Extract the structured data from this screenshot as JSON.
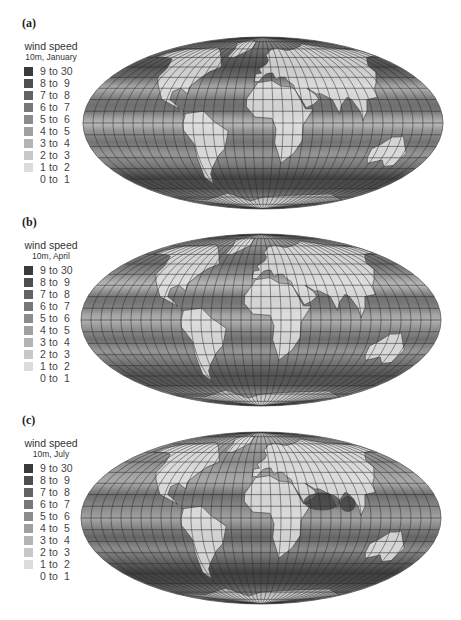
{
  "figure": {
    "panels": [
      {
        "id": "a",
        "label": "(a)",
        "legend_title": "wind speed",
        "legend_subtitle": "10m, January",
        "month": "January"
      },
      {
        "id": "b",
        "label": "(b)",
        "legend_title": "wind speed",
        "legend_subtitle": "10m, April",
        "month": "April"
      },
      {
        "id": "c",
        "label": "(c)",
        "legend_title": "wind speed",
        "legend_subtitle": "10m, July",
        "month": "July"
      }
    ],
    "legend_classes": [
      {
        "range": "9 to 30",
        "color": "#3a3a3a"
      },
      {
        "range": "8 to  9",
        "color": "#4e4e4e"
      },
      {
        "range": "7 to  8",
        "color": "#636363"
      },
      {
        "range": "6 to  7",
        "color": "#787878"
      },
      {
        "range": "5 to  6",
        "color": "#8c8c8c"
      },
      {
        "range": "4 to  5",
        "color": "#a0a0a0"
      },
      {
        "range": "3 to  4",
        "color": "#b4b4b4"
      },
      {
        "range": "2 to  3",
        "color": "#c8c8c8"
      },
      {
        "range": "1 to  2",
        "color": "#dcdcdc"
      },
      {
        "range": "0 to  1",
        "color": "#ffffff"
      }
    ],
    "projection": "Mollweide",
    "graticule_spacing_deg": 10
  },
  "chart_data": [
    {
      "type": "heatmap",
      "title": "wind speed 10m, January",
      "panel": "(a)",
      "units": "m/s",
      "legend_bins": [
        "9 to 30",
        "8 to 9",
        "7 to 8",
        "6 to 7",
        "5 to 6",
        "4 to 5",
        "3 to 4",
        "2 to 3",
        "1 to 2",
        "0 to 1"
      ],
      "zonal_bands_approx": [
        {
          "lat": "60N-50N",
          "class": "8 to 9"
        },
        {
          "lat": "40N",
          "class": "7 to 8"
        },
        {
          "lat": "20N-10N trade winds",
          "class": "6 to 7"
        },
        {
          "lat": "0",
          "class": "4 to 5"
        },
        {
          "lat": "20S-10S",
          "class": "5 to 6"
        },
        {
          "lat": "50S-40S",
          "class": "9 to 30"
        }
      ]
    },
    {
      "type": "heatmap",
      "title": "wind speed 10m, April",
      "panel": "(b)",
      "units": "m/s",
      "legend_bins": [
        "9 to 30",
        "8 to 9",
        "7 to 8",
        "6 to 7",
        "5 to 6",
        "4 to 5",
        "3 to 4",
        "2 to 3",
        "1 to 2",
        "0 to 1"
      ],
      "zonal_bands_approx": [
        {
          "lat": "60N-50N",
          "class": "6 to 7"
        },
        {
          "lat": "20N-10N trade winds",
          "class": "6 to 7"
        },
        {
          "lat": "0",
          "class": "4 to 5"
        },
        {
          "lat": "20S-10S",
          "class": "6 to 7"
        },
        {
          "lat": "50S-40S",
          "class": "8 to 9"
        }
      ]
    },
    {
      "type": "heatmap",
      "title": "wind speed 10m, July",
      "panel": "(c)",
      "units": "m/s",
      "legend_bins": [
        "9 to 30",
        "8 to 9",
        "7 to 8",
        "6 to 7",
        "5 to 6",
        "4 to 5",
        "3 to 4",
        "2 to 3",
        "1 to 2",
        "0 to 1"
      ],
      "zonal_bands_approx": [
        {
          "lat": "60N-50N",
          "class": "5 to 6"
        },
        {
          "lat": "20N-10N Arabian Sea monsoon",
          "class": "9 to 30"
        },
        {
          "lat": "0",
          "class": "5 to 6"
        },
        {
          "lat": "20S-10S",
          "class": "7 to 8"
        },
        {
          "lat": "50S-40S",
          "class": "9 to 30"
        }
      ]
    }
  ]
}
